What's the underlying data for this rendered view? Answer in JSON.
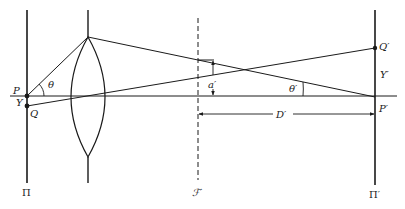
{
  "diagram": {
    "type": "optical ray diagram",
    "colors": {
      "line": "#1a1a1a",
      "background": "#ffffff"
    },
    "planes": {
      "object": {
        "label": "Π",
        "x": 27
      },
      "image": {
        "label": "Π′",
        "x": 375
      },
      "focal": {
        "label": "ℱ′",
        "x": 198
      }
    },
    "points": {
      "P": {
        "label": "P",
        "x": 27,
        "y": 96
      },
      "Q": {
        "label": "Q",
        "x": 27,
        "y": 106
      },
      "P_prime": {
        "label": "P′",
        "x": 375,
        "y": 97
      },
      "Q_prime": {
        "label": "Q′",
        "x": 375,
        "y": 48
      }
    },
    "labels": {
      "theta": "θ",
      "theta_prime": "θ′",
      "Y": "Y",
      "Y_prime": "Y′",
      "a_prime": "a′",
      "D_prime": "D′"
    }
  }
}
